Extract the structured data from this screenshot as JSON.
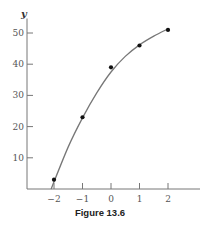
{
  "chart_data": {
    "type": "scatter",
    "title": "",
    "xlabel": "x",
    "ylabel": "y",
    "xlim": [
      -2.9,
      3.2
    ],
    "ylim": [
      0,
      54
    ],
    "x_ticks": [
      -2,
      -1,
      0,
      1,
      2
    ],
    "x_tick_labels": [
      "−2",
      "−1",
      "0",
      "1",
      "2"
    ],
    "y_ticks": [
      10,
      20,
      30,
      40,
      50
    ],
    "y_tick_labels": [
      "10",
      "20",
      "30",
      "40",
      "50"
    ],
    "grid": false,
    "legend": "none",
    "series": [
      {
        "name": "data points",
        "type": "scatter",
        "x": [
          -2,
          -1,
          0,
          1,
          2
        ],
        "y": [
          3,
          23,
          39,
          46,
          51
        ]
      },
      {
        "name": "fitted curve",
        "type": "line",
        "x": [
          -2.1,
          -1.5,
          -1,
          -0.5,
          0,
          0.5,
          1,
          1.5,
          2
        ],
        "y": [
          0,
          13.5,
          22.8,
          30.8,
          37.5,
          42.5,
          46.2,
          49.0,
          51.3
        ]
      }
    ],
    "colors": {
      "points": "#111111",
      "curve": "#777777",
      "axes": "#777777"
    }
  },
  "caption": "Figure 13.6"
}
